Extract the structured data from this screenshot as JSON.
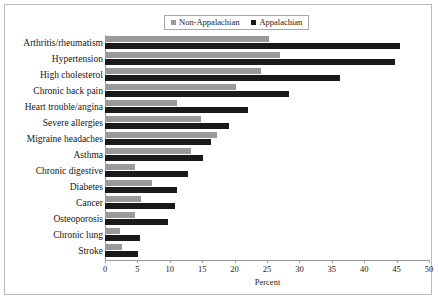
{
  "chart_data": {
    "type": "bar",
    "orientation": "horizontal",
    "title": "",
    "xlabel": "Percent",
    "ylabel": "",
    "xlim": [
      0,
      50
    ],
    "xticks": [
      0,
      5,
      10,
      15,
      20,
      25,
      30,
      35,
      40,
      45,
      50
    ],
    "xtick_labels": [
      "0",
      "5",
      "10",
      "15",
      "20",
      "25",
      "30",
      "35",
      "40",
      "45",
      "50"
    ],
    "grid": false,
    "legend_position": "top-center",
    "categories": [
      "Arthritis/rheumatism",
      "Hypertension",
      "High cholesterol",
      "Chronic back pain",
      "Heart trouble/angina",
      "Severe allergies",
      "Migraine headaches",
      "Asthma",
      "Chronic digestive",
      "Diabetes",
      "Cancer",
      "Osteoporosis",
      "Chronic lung",
      "Stroke"
    ],
    "series": [
      {
        "name": "Non-Appalachian",
        "color": "#9a9a9a",
        "values": [
          25.3,
          27.0,
          24.0,
          20.2,
          11.1,
          14.8,
          17.3,
          13.3,
          4.6,
          7.3,
          5.6,
          4.6,
          2.3,
          2.6
        ]
      },
      {
        "name": "Appalachian",
        "color": "#1a1a1a",
        "values": [
          45.5,
          44.7,
          36.3,
          28.4,
          22.0,
          19.1,
          16.4,
          15.1,
          12.8,
          11.1,
          10.8,
          9.7,
          5.4,
          5.1
        ]
      }
    ]
  },
  "legend": {
    "entries": [
      {
        "label": "Non-Appalachian",
        "color": "#9a9a9a"
      },
      {
        "label": "Appalachian",
        "color": "#1a1a1a"
      }
    ]
  },
  "colors": {
    "non_appalachian": "#9a9a9a",
    "appalachian": "#1a1a1a",
    "axis": "#9b9b9b",
    "frame": "#b9b9b9",
    "text": "#1a1a1a"
  }
}
